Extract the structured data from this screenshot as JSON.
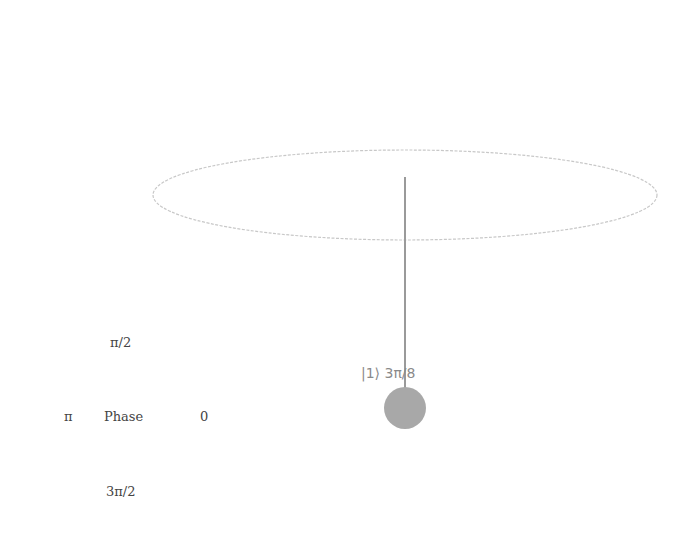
{
  "qsphere": {
    "state_label": "|1⟩ 3π/8",
    "ket": "|1⟩",
    "phase": "3π/8",
    "colors": {
      "equator": "#c8c8c8",
      "vector": "#9a9a9a",
      "state_point": "#a8a8a8",
      "label": "#8a8a8a"
    }
  },
  "phase_legend": {
    "title": "Phase",
    "top": "π/2",
    "left": "π",
    "right": "0",
    "bottom": "3π/2"
  }
}
